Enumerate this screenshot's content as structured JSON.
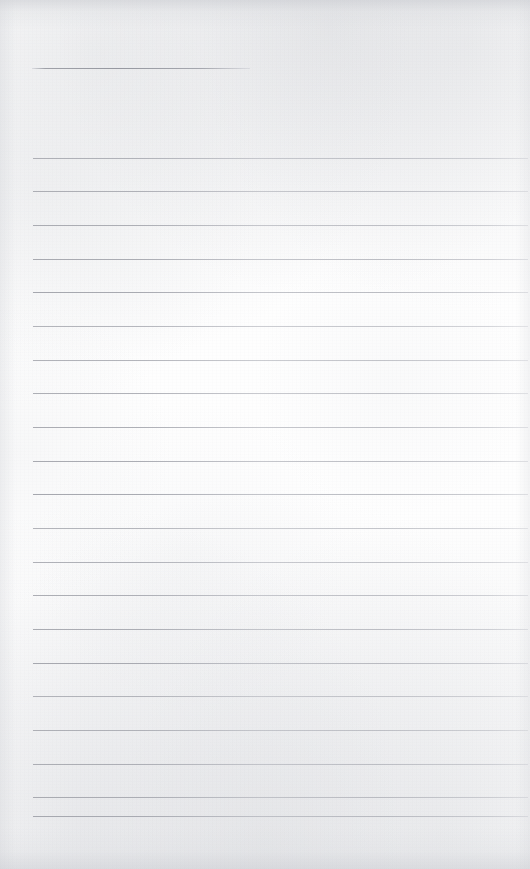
{
  "document": {
    "type": "scanned-lined-paper",
    "title": "Blank ruled notebook page",
    "description": "A scanned blank sheet of ruled (lined) writing paper with no handwriting or printed text.",
    "width_px": 530,
    "height_px": 869,
    "text_content": "",
    "background_color": "#fefefe",
    "rule_color": "#9aa0a8",
    "edge_shadow_color": "#c6c8ce"
  },
  "header_rule": {
    "label": "header-rule",
    "y": 68,
    "x_start": 32,
    "x_end": 250,
    "thickness_px": 1
  },
  "ruling": {
    "label": "body-rules",
    "count": 20,
    "first_y": 158,
    "spacing_px": 33.7,
    "x_start": 33,
    "x_end": 528,
    "thickness_px": 1,
    "lines": [
      {
        "index": 1,
        "y": 158
      },
      {
        "index": 2,
        "y": 191
      },
      {
        "index": 3,
        "y": 225
      },
      {
        "index": 4,
        "y": 259
      },
      {
        "index": 5,
        "y": 292
      },
      {
        "index": 6,
        "y": 326
      },
      {
        "index": 7,
        "y": 360
      },
      {
        "index": 8,
        "y": 393
      },
      {
        "index": 9,
        "y": 427
      },
      {
        "index": 10,
        "y": 461
      },
      {
        "index": 11,
        "y": 494
      },
      {
        "index": 12,
        "y": 528
      },
      {
        "index": 13,
        "y": 562
      },
      {
        "index": 14,
        "y": 595
      },
      {
        "index": 15,
        "y": 629
      },
      {
        "index": 16,
        "y": 663
      },
      {
        "index": 17,
        "y": 696
      },
      {
        "index": 18,
        "y": 730
      },
      {
        "index": 19,
        "y": 764
      },
      {
        "index": 20,
        "y": 797
      },
      {
        "index": 21,
        "y": 816
      }
    ]
  }
}
